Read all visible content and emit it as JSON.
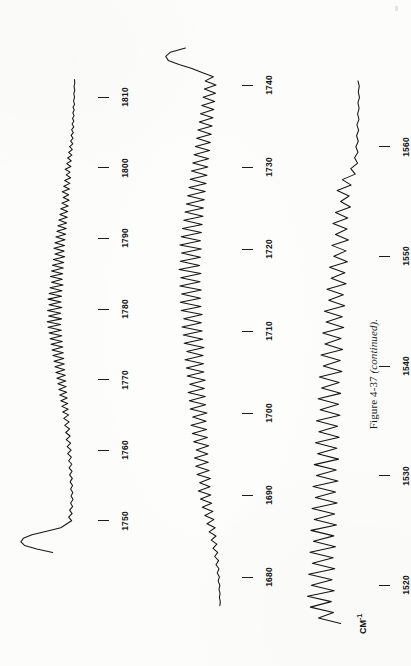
{
  "figure": {
    "caption_main": "Figure 4-37",
    "caption_note": "(continued).",
    "axis_unit_label": "CM",
    "axis_unit_exponent": "-1",
    "ink_color": "#151515",
    "paper_color": "#fcfcfa"
  },
  "chart_data": {
    "type": "line",
    "title": "Figure 4-37 (continued).",
    "subtitle": "",
    "xlabel": "CM-1",
    "ylabel": "",
    "orientation": "rotated-90ccw",
    "grid": false,
    "legend": null,
    "panels": [
      {
        "name": "panel-1",
        "tick_labels": [
          "1750",
          "1760",
          "1770",
          "1780",
          "1790",
          "1800",
          "1810"
        ],
        "tick_values": [
          1750,
          1760,
          1770,
          1780,
          1790,
          1800,
          1810
        ],
        "xlim": [
          1745,
          1815
        ],
        "note": "strong broad band near 1748; dense rotational fine structure 1755-1805; baseline toward 1812",
        "series": [
          {
            "name": "absorbance",
            "x": [
              1812.5,
              1812.0,
              1811.5,
              1811.0,
              1810.5,
              1810.0,
              1809.5,
              1809.0,
              1808.6,
              1808.2,
              1807.8,
              1807.4,
              1807.0,
              1806.6,
              1806.2,
              1805.8,
              1805.4,
              1805.0,
              1804.6,
              1804.2,
              1803.8,
              1803.4,
              1803.0,
              1802.6,
              1802.2,
              1801.8,
              1801.4,
              1801.0,
              1800.6,
              1800.2,
              1799.8,
              1799.4,
              1799.0,
              1798.6,
              1798.2,
              1797.8,
              1797.4,
              1797.0,
              1796.6,
              1796.2,
              1795.8,
              1795.4,
              1795.0,
              1794.6,
              1794.2,
              1793.8,
              1793.4,
              1793.0,
              1792.6,
              1792.2,
              1791.8,
              1791.4,
              1791.0,
              1790.6,
              1790.2,
              1789.8,
              1789.4,
              1789.0,
              1788.6,
              1788.2,
              1787.8,
              1787.4,
              1787.0,
              1786.6,
              1786.2,
              1785.8,
              1785.4,
              1785.0,
              1784.6,
              1784.2,
              1783.8,
              1783.4,
              1783.0,
              1782.6,
              1782.2,
              1781.8,
              1781.4,
              1781.0,
              1780.6,
              1780.2,
              1779.8,
              1779.4,
              1779.0,
              1778.6,
              1778.2,
              1777.8,
              1777.4,
              1777.0,
              1776.6,
              1776.2,
              1775.8,
              1775.4,
              1775.0,
              1774.6,
              1774.2,
              1773.8,
              1773.4,
              1773.0,
              1772.6,
              1772.2,
              1771.8,
              1771.4,
              1771.0,
              1770.6,
              1770.2,
              1769.8,
              1769.4,
              1769.0,
              1768.6,
              1768.2,
              1767.8,
              1767.4,
              1767.0,
              1766.6,
              1766.2,
              1765.8,
              1765.4,
              1765.0,
              1764.5,
              1764.0,
              1763.5,
              1763.0,
              1762.5,
              1762.0,
              1761.5,
              1761.0,
              1760.5,
              1760.0,
              1759.5,
              1759.0,
              1758.5,
              1758.0,
              1757.5,
              1757.0,
              1756.5,
              1756.0,
              1755.5,
              1755.0,
              1754.5,
              1754.0,
              1753.5,
              1753.0,
              1752.5,
              1752.0,
              1751.5,
              1751.0,
              1750.5,
              1750.0,
              1749.5,
              1749.0,
              1748.5,
              1748.0,
              1747.5,
              1747.0,
              1746.5,
              1746.0,
              1745.5
            ],
            "y": [
              6,
              5,
              8,
              5,
              9,
              6,
              10,
              6,
              12,
              7,
              13,
              8,
              14,
              9,
              16,
              9,
              18,
              11,
              20,
              12,
              22,
              13,
              26,
              15,
              30,
              17,
              34,
              19,
              38,
              21,
              44,
              24,
              40,
              22,
              46,
              25,
              50,
              27,
              56,
              30,
              52,
              28,
              58,
              32,
              62,
              34,
              66,
              36,
              70,
              38,
              74,
              40,
              78,
              42,
              82,
              45,
              86,
              47,
              90,
              49,
              86,
              46,
              92,
              50,
              96,
              52,
              100,
              54,
              104,
              56,
              100,
              53,
              106,
              57,
              110,
              59,
              114,
              61,
              110,
              58,
              116,
              62,
              112,
              59,
              118,
              63,
              114,
              60,
              110,
              58,
              106,
              56,
              102,
              54,
              98,
              52,
              94,
              50,
              90,
              48,
              86,
              46,
              82,
              44,
              78,
              42,
              74,
              40,
              70,
              38,
              66,
              36,
              62,
              34,
              58,
              32,
              54,
              30,
              50,
              28,
              46,
              26,
              42,
              24,
              40,
              22,
              36,
              20,
              34,
              19,
              30,
              17,
              28,
              16,
              26,
              15,
              24,
              14,
              22,
              13,
              20,
              12,
              22,
              14,
              26,
              16,
              30,
              18,
              40,
              62,
              120,
              180,
              215,
              225,
              210,
              160,
              95,
              40
            ]
          }
        ]
      },
      {
        "name": "panel-2",
        "tick_labels": [
          "1680",
          "1690",
          "1700",
          "1710",
          "1720",
          "1730",
          "1740"
        ],
        "tick_values": [
          1680,
          1690,
          1700,
          1710,
          1720,
          1730,
          1740
        ],
        "xlim": [
          1675,
          1745
        ],
        "note": "very strong broad band near 1742; sharp regularly spaced lines 1685-1738; flat baseline at 1677",
        "series": [
          {
            "name": "absorbance",
            "x": [
              1676.5,
              1677.0,
              1677.5,
              1678.0,
              1678.5,
              1679.0,
              1679.5,
              1680.0,
              1680.5,
              1681.0,
              1681.5,
              1682.0,
              1682.5,
              1683.0,
              1683.5,
              1684.0,
              1684.5,
              1685.0,
              1685.5,
              1686.0,
              1686.5,
              1687.0,
              1687.5,
              1688.0,
              1688.5,
              1689.0,
              1689.5,
              1690.0,
              1690.5,
              1691.0,
              1691.5,
              1692.0,
              1692.5,
              1693.0,
              1693.5,
              1694.0,
              1694.5,
              1695.0,
              1695.5,
              1696.0,
              1696.5,
              1697.0,
              1697.5,
              1698.0,
              1698.5,
              1699.0,
              1699.5,
              1700.0,
              1700.5,
              1701.0,
              1701.5,
              1702.0,
              1702.5,
              1703.0,
              1703.5,
              1704.0,
              1704.5,
              1705.0,
              1705.5,
              1706.0,
              1706.5,
              1707.0,
              1707.5,
              1708.0,
              1708.5,
              1709.0,
              1709.5,
              1710.0,
              1710.5,
              1711.0,
              1711.5,
              1712.0,
              1712.5,
              1713.0,
              1713.5,
              1714.0,
              1714.5,
              1715.0,
              1715.5,
              1716.0,
              1716.5,
              1717.0,
              1717.5,
              1718.0,
              1718.5,
              1719.0,
              1719.5,
              1720.0,
              1720.5,
              1721.0,
              1721.5,
              1722.0,
              1722.5,
              1723.0,
              1723.5,
              1724.0,
              1724.5,
              1725.0,
              1725.5,
              1726.0,
              1726.5,
              1727.0,
              1727.5,
              1728.0,
              1728.5,
              1729.0,
              1729.5,
              1730.0,
              1730.5,
              1731.0,
              1731.5,
              1732.0,
              1732.5,
              1733.0,
              1733.5,
              1734.0,
              1734.5,
              1735.0,
              1735.5,
              1736.0,
              1736.5,
              1737.0,
              1737.5,
              1738.0,
              1738.5,
              1739.0,
              1739.5,
              1740.0,
              1740.5,
              1741.0,
              1741.5,
              1742.0,
              1742.5,
              1743.0,
              1743.5,
              1744.0,
              1744.5
            ],
            "y": [
              10,
              8,
              12,
              9,
              14,
              10,
              18,
              12,
              22,
              14,
              28,
              16,
              34,
              20,
              42,
              24,
              50,
              28,
              60,
              32,
              70,
              38,
              80,
              42,
              92,
              48,
              100,
              52,
              110,
              56,
              104,
              54,
              116,
              60,
              122,
              64,
              128,
              66,
              120,
              62,
              132,
              68,
              138,
              72,
              144,
              74,
              136,
              70,
              148,
              76,
              152,
              78,
              158,
              82,
              150,
              78,
              162,
              84,
              166,
              86,
              172,
              88,
              164,
              84,
              176,
              90,
              180,
              92,
              186,
              96,
              178,
              92,
              190,
              98,
              194,
              100,
              188,
              96,
              196,
              102,
              192,
              98,
              200,
              104,
              194,
              100,
              188,
              96,
              196,
              100,
              190,
              96,
              184,
              92,
              178,
              88,
              172,
              86,
              166,
              82,
              160,
              78,
              154,
              74,
              148,
              70,
              142,
              66,
              136,
              62,
              130,
              58,
              124,
              54,
              118,
              50,
              112,
              46,
              106,
              42,
              100,
              38,
              94,
              34,
              88,
              30,
              82,
              28,
              78,
              40,
              90,
              140,
              200,
              250,
              262,
              240,
              170,
              80,
              30
            ]
          }
        ]
      },
      {
        "name": "panel-3",
        "tick_labels": [
          "1520",
          "1530",
          "1540",
          "1550",
          "1560"
        ],
        "tick_values": [
          1520,
          1530,
          1540,
          1550,
          1560
        ],
        "xlim": [
          1515,
          1567
        ],
        "note": "moderately resolved band cluster 1520-1558; weak structured baseline below 1562",
        "series": [
          {
            "name": "absorbance",
            "x": [
              1566.0,
              1565.5,
              1565.0,
              1564.5,
              1564.0,
              1563.5,
              1563.0,
              1562.5,
              1562.0,
              1561.5,
              1561.0,
              1560.5,
              1560.0,
              1559.5,
              1559.0,
              1558.5,
              1558.0,
              1557.5,
              1557.0,
              1556.5,
              1556.0,
              1555.5,
              1555.0,
              1554.5,
              1554.0,
              1553.5,
              1553.0,
              1552.5,
              1552.0,
              1551.5,
              1551.0,
              1550.5,
              1550.0,
              1549.5,
              1549.0,
              1548.5,
              1548.0,
              1547.5,
              1547.0,
              1546.5,
              1546.0,
              1545.5,
              1545.0,
              1544.5,
              1544.0,
              1543.5,
              1543.0,
              1542.5,
              1542.0,
              1541.5,
              1541.0,
              1540.5,
              1540.0,
              1539.5,
              1539.0,
              1538.5,
              1538.0,
              1537.5,
              1537.0,
              1536.5,
              1536.0,
              1535.5,
              1535.0,
              1534.5,
              1534.0,
              1533.5,
              1533.0,
              1532.5,
              1532.0,
              1531.5,
              1531.0,
              1530.5,
              1530.0,
              1529.5,
              1529.0,
              1528.5,
              1528.0,
              1527.5,
              1527.0,
              1526.5,
              1526.0,
              1525.5,
              1525.0,
              1524.5,
              1524.0,
              1523.5,
              1523.0,
              1522.5,
              1522.0,
              1521.5,
              1521.0,
              1520.5,
              1520.0,
              1519.5,
              1519.0,
              1518.5,
              1518.0,
              1517.5,
              1517.0,
              1516.5,
              1516.0,
              1515.5
            ],
            "y": [
              18,
              10,
              16,
              9,
              18,
              11,
              20,
              12,
              24,
              14,
              26,
              16,
              30,
              18,
              38,
              20,
              60,
              34,
              110,
              58,
              140,
              70,
              120,
              62,
              150,
              78,
              165,
              82,
              150,
              74,
              172,
              88,
              160,
              80,
              185,
              95,
              175,
              88,
              200,
              104,
              190,
              96,
              215,
              110,
              205,
              102,
              225,
              118,
              212,
              108,
              235,
              122,
              222,
              112,
              245,
              128,
              232,
              120,
              252,
              132,
              240,
              124,
              262,
              138,
              248,
              128,
              268,
              142,
              255,
              132,
              275,
              146,
              262,
              136,
              282,
              150,
              268,
              140,
              288,
              155,
              275,
              144,
              295,
              160,
              280,
              150,
              300,
              164,
              286,
              154,
              308,
              170,
              292,
              158,
              315,
              175,
              298,
              162,
              250,
              120
            ]
          }
        ]
      }
    ]
  }
}
